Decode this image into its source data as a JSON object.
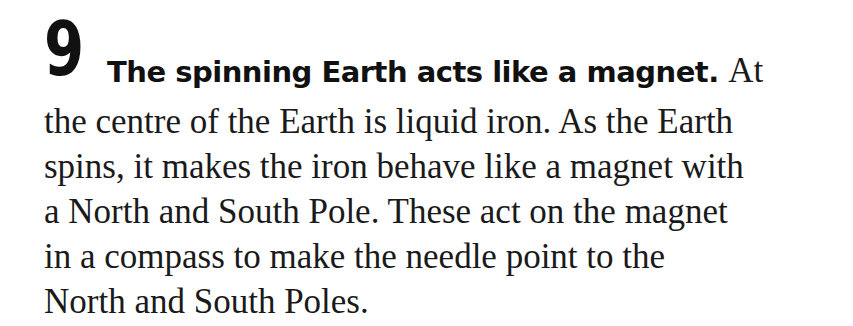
{
  "fact": {
    "number": "9",
    "heading": "The spinning Earth acts like a magnet.",
    "first_line_tail": "At",
    "body_lines": [
      "the centre of the Earth is liquid iron. As the Earth",
      "spins, it makes the iron behave like a magnet with",
      "a North and South Pole. These act on the magnet",
      "in a compass to make the needle point to the",
      "North and South Poles."
    ]
  }
}
